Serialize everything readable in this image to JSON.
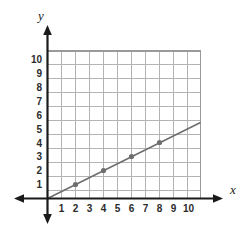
{
  "chart_data": {
    "type": "line",
    "title": "",
    "xlabel": "x",
    "ylabel": "y",
    "xlim": [
      0,
      11
    ],
    "ylim": [
      0,
      11
    ],
    "grid": true,
    "legend": null,
    "xticks": [
      1,
      2,
      3,
      4,
      5,
      6,
      7,
      8,
      9,
      10
    ],
    "yticks": [
      1,
      2,
      3,
      4,
      5,
      6,
      7,
      8,
      9,
      10
    ],
    "xtick_labels": [
      "1",
      "2",
      "3",
      "4",
      "5",
      "6",
      "7",
      "8",
      "9",
      "10"
    ],
    "ytick_labels": [
      "1",
      "2",
      "3",
      "4",
      "5",
      "6",
      "7",
      "8",
      "9",
      "10"
    ],
    "series": [
      {
        "name": "line",
        "equation": "y = 0.5x",
        "slope": 0.5,
        "intercept": 0,
        "line_from": [
          0,
          0
        ],
        "line_to": [
          11,
          5.5
        ],
        "marked_points": [
          {
            "x": 2,
            "y": 1
          },
          {
            "x": 4,
            "y": 2
          },
          {
            "x": 6,
            "y": 3
          },
          {
            "x": 8,
            "y": 4
          }
        ]
      }
    ]
  },
  "colors": {
    "background": "#ffffff",
    "axis": "#1a1a1a",
    "grid": "#b0b0b0",
    "grid_border": "#9a9a9a",
    "line": "#6e6e6e",
    "point": "#6e6e6e",
    "tick_text": "#2b2b2b"
  }
}
